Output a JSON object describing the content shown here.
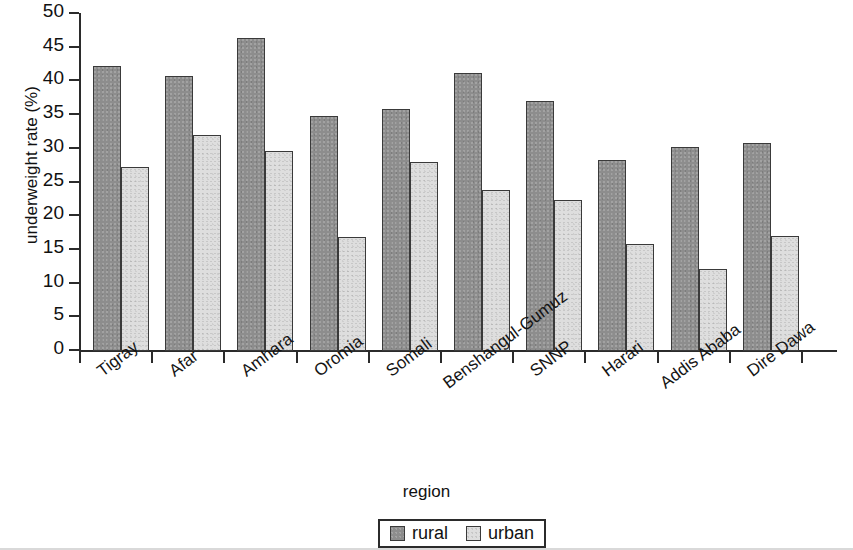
{
  "chart_data": {
    "type": "bar",
    "title": "",
    "xlabel": "region",
    "ylabel": "underweight rate (%)",
    "categories": [
      "Tigray",
      "Afar",
      "Amhara",
      "Oromia",
      "Somali",
      "Benshangul-Gumuz",
      "SNNP",
      "Harari",
      "Addis Ababa",
      "Dire Dawa"
    ],
    "series": [
      {
        "name": "rural",
        "color": "#8d8d8d",
        "values": [
          42.3,
          40.8,
          46.4,
          34.9,
          35.9,
          41.2,
          37.1,
          28.4,
          30.3,
          30.9
        ]
      },
      {
        "name": "urban",
        "color": "#dedede",
        "values": [
          27.3,
          32.1,
          29.7,
          16.9,
          28.0,
          23.9,
          22.4,
          15.9,
          12.2,
          17.1
        ]
      }
    ],
    "ylim": [
      0,
      50
    ],
    "yticks": [
      0,
      5,
      10,
      15,
      20,
      25,
      30,
      35,
      40,
      45,
      50
    ],
    "ytick_labels": [
      "0",
      "5",
      "10",
      "15",
      "20",
      "25",
      "30",
      "35",
      "40",
      "45",
      "50"
    ],
    "grid": false,
    "legend_position": "bottom-center",
    "legend_entries": [
      "rural",
      "urban"
    ]
  }
}
